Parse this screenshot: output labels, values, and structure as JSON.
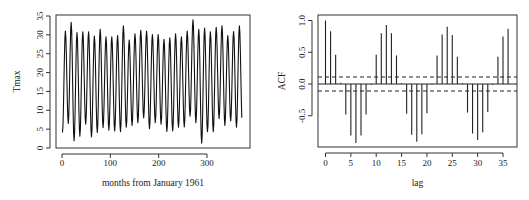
{
  "figure": {
    "panels": [
      "timeseries",
      "acf"
    ]
  },
  "chart_data": [
    {
      "type": "line",
      "title": "",
      "xlabel": "months from January 1961",
      "ylabel": "Tmax",
      "xlim": [
        0,
        372
      ],
      "ylim": [
        0,
        35
      ],
      "xticks": [
        0,
        100,
        200,
        300
      ],
      "yticks": [
        0,
        5,
        10,
        15,
        20,
        25,
        30,
        35
      ],
      "grid": false,
      "legend": null,
      "description": "Monthly maximum temperature, strong annual cycle; yearly peaks (~month 7 of each year) and troughs (~month 1)",
      "annual_troughs": [
        4.1,
        6.5,
        1.9,
        3.1,
        6.3,
        2.9,
        4.1,
        5.4,
        4.7,
        4.5,
        4.3,
        5.5,
        6.0,
        6.7,
        8.0,
        5.1,
        6.7,
        6.3,
        4.4,
        4.5,
        5.5,
        5.6,
        8.4,
        6.7,
        1.3,
        4.3,
        4.3,
        7.8,
        6.0,
        7.2,
        5.5,
        6.3
      ],
      "annual_peaks": [
        31.0,
        33.3,
        30.6,
        30.8,
        30.8,
        29.7,
        31.5,
        29.5,
        29.5,
        29.8,
        32.4,
        28.6,
        30.3,
        31.2,
        31.0,
        30.1,
        30.1,
        28.8,
        29.2,
        30.3,
        29.5,
        31.0,
        34.0,
        31.5,
        31.8,
        30.8,
        32.0,
        32.4,
        29.8,
        30.9,
        32.4
      ]
    },
    {
      "type": "bar",
      "title": "",
      "xlabel": "lag",
      "ylabel": "ACF",
      "xlim": [
        0,
        36
      ],
      "ylim": [
        -1.0,
        1.05
      ],
      "xticks": [
        0,
        5,
        10,
        15,
        20,
        25,
        30,
        35
      ],
      "yticks": [
        -0.5,
        0.0,
        0.5,
        1.0
      ],
      "ytick_labels": [
        "-0.5",
        "0.0",
        "0.5",
        "1.0"
      ],
      "grid": false,
      "legend": null,
      "confidence_bound": 0.11,
      "categories": [
        0,
        1,
        2,
        3,
        4,
        5,
        6,
        7,
        8,
        9,
        10,
        11,
        12,
        13,
        14,
        15,
        16,
        17,
        18,
        19,
        20,
        21,
        22,
        23,
        24,
        25,
        26,
        27,
        28,
        29,
        30,
        31,
        32,
        33,
        34,
        35,
        36
      ],
      "values": [
        1.0,
        0.83,
        0.46,
        0.02,
        -0.48,
        -0.81,
        -0.93,
        -0.81,
        -0.48,
        -0.01,
        0.46,
        0.8,
        0.93,
        0.8,
        0.45,
        0.01,
        -0.47,
        -0.8,
        -0.91,
        -0.79,
        -0.46,
        -0.01,
        0.45,
        0.78,
        0.9,
        0.77,
        0.43,
        0.01,
        -0.45,
        -0.78,
        -0.88,
        -0.76,
        -0.44,
        -0.01,
        0.43,
        0.75,
        0.87
      ]
    }
  ],
  "layout": {
    "panels": [
      {
        "frame": {
          "x0": 56,
          "y0": 15,
          "x1": 250,
          "y1": 148
        },
        "xmap": {
          "v0": 0,
          "p0": 62,
          "v1": 300,
          "p1": 207
        },
        "ymap": {
          "v0": 0,
          "p0": 148,
          "v1": 35,
          "p1": 16
        },
        "xlabel_y": 186,
        "ylabel_x": 20,
        "tick_label_y": 166,
        "ytick_label_x": 43
      },
      {
        "frame": {
          "x0": 318,
          "y0": 15,
          "x1": 517,
          "y1": 147
        },
        "xmap": {
          "v0": 0,
          "p0": 325.5,
          "v1": 35,
          "p1": 503
        },
        "ymap": {
          "v0": 0,
          "p0": 84,
          "v1": 1,
          "p1": 20.5
        },
        "xlabel_y": 186,
        "ylabel_x": 285,
        "tick_label_y": 166,
        "ytick_label_x": 305
      }
    ]
  }
}
